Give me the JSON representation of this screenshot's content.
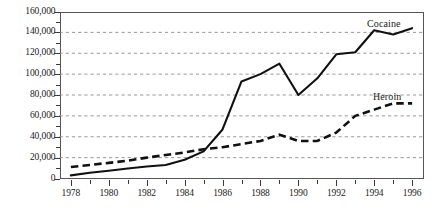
{
  "chart_data": {
    "type": "line",
    "title": "",
    "subtitle": "",
    "xlabel": "",
    "ylabel": "",
    "x": [
      1978,
      1979,
      1980,
      1981,
      1982,
      1983,
      1984,
      1985,
      1986,
      1987,
      1988,
      1989,
      1990,
      1991,
      1992,
      1993,
      1994,
      1995,
      1996
    ],
    "xlim": [
      1977.4,
      1996.6
    ],
    "ylim": [
      0,
      160000
    ],
    "ytick_values": [
      0,
      20000,
      40000,
      60000,
      80000,
      100000,
      120000,
      140000,
      160000
    ],
    "ytick_labels": [
      "0",
      "20,000",
      "40,000",
      "60,000",
      "80,000",
      "100,000",
      "120,000",
      "140,000",
      "160,000"
    ],
    "xtick_major_values": [
      1978,
      1980,
      1982,
      1984,
      1986,
      1988,
      1990,
      1992,
      1994,
      1996
    ],
    "xtick_major_labels": [
      "1978",
      "1980",
      "1982",
      "1984",
      "1986",
      "1988",
      "1990",
      "1992",
      "1994",
      "1996"
    ],
    "xtick_minor_values": [
      1979,
      1981,
      1983,
      1985,
      1987,
      1989,
      1991,
      1993,
      1995
    ],
    "ytick_minor_values": [
      10000,
      30000,
      50000,
      70000,
      90000,
      110000,
      130000,
      150000
    ],
    "grid": "horizontal-dashed",
    "legend_position": "inline-right",
    "series": [
      {
        "name": "Cocaine",
        "style": "solid",
        "color": "#111111",
        "label_text": "Cocaine",
        "values": [
          3000,
          5500,
          7500,
          9500,
          11500,
          13000,
          18000,
          26000,
          47000,
          93000,
          100000,
          110000,
          80000,
          96000,
          119000,
          121000,
          142000,
          138000,
          144000
        ]
      },
      {
        "name": "Heroin",
        "style": "dashed",
        "color": "#111111",
        "label_text": "Heroin",
        "values": [
          11000,
          13000,
          15000,
          17000,
          20000,
          22500,
          25000,
          28000,
          30000,
          33000,
          36000,
          42000,
          36000,
          36000,
          44000,
          60000,
          66000,
          72000,
          72000
        ]
      }
    ]
  },
  "axis": {
    "y_axis_name": "y-axis",
    "x_axis_name": "x-axis"
  }
}
